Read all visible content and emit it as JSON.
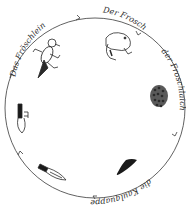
{
  "diagram": {
    "stages": [
      {
        "id": "froeschlein",
        "label": "Das Fröschlein",
        "icon": "froglet-icon"
      },
      {
        "id": "frosch",
        "label": "Der Frosch",
        "icon": "frog-icon"
      },
      {
        "id": "froschlaich",
        "label": "der Froschlaich",
        "icon": "frogspawn-icon"
      },
      {
        "id": "kaulquappe",
        "label": "die Kaulquappe",
        "icon": "tadpole-icon"
      }
    ],
    "cycle_direction": "clockwise",
    "colors": {
      "ink": "#2a2a2a",
      "fill_dark": "#1a1a1a",
      "spawn": "#555555"
    }
  }
}
